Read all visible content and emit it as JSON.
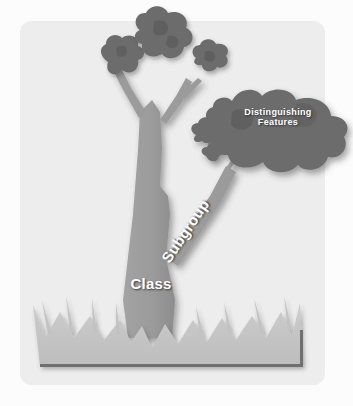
{
  "diagram": {
    "palette": {
      "page_background": "#fcfcfc",
      "panel_background": "#ededed",
      "trunk": "#9b9b9b",
      "trunk_shadow": "#8a8a8a",
      "foliage": "#6c6c6c",
      "foliage_dark": "#606060",
      "grass": "#c6c6c6",
      "grass_shadow": "#b0b0b0",
      "baseline": "#6a6a6a",
      "label_text": "#ffffff"
    },
    "labels": {
      "class": "Class",
      "subgroup": "Subgroup",
      "features_line1": "Distinguishing",
      "features_line2": "Features"
    },
    "parts": {
      "panel": "rounded-panel",
      "trunk": "tree-trunk",
      "branch": "subgroup-branch",
      "foliage_left": "foliage-cluster-left",
      "foliage_top": "foliage-cluster-top",
      "foliage_right_small": "foliage-cluster-right-small",
      "foliage_features": "foliage-cluster-features",
      "grass": "grass-base",
      "baseline": "ground-baseline"
    }
  }
}
